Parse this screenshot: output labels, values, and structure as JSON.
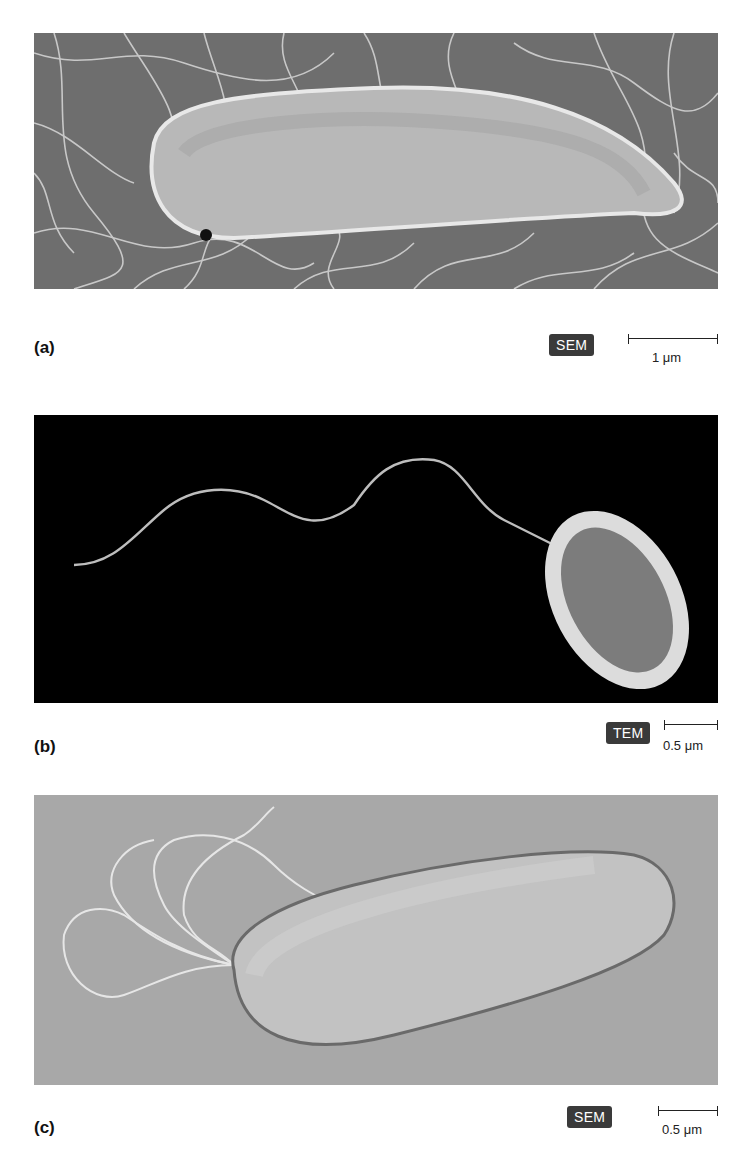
{
  "figure": {
    "panels": [
      {
        "id": "a",
        "label": "(a)",
        "microscopy": "SEM",
        "scale": "1 μm",
        "description": "Rod-shaped bacterium with numerous peritrichous flagella on a textured grey surface"
      },
      {
        "id": "b",
        "label": "(b)",
        "microscopy": "TEM",
        "scale": "0.5 μm",
        "description": "Oval bacterium with a single long wavy polar flagellum on a black background"
      },
      {
        "id": "c",
        "label": "(c)",
        "microscopy": "SEM",
        "scale": "0.5 μm",
        "description": "Rod-shaped bacterium with a tuft of looping flagella at one pole on a light grey surface"
      }
    ]
  }
}
